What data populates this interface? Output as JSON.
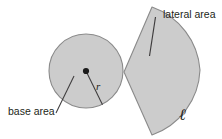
{
  "figure": {
    "labels": {
      "base_area": "base area",
      "lateral_area": "lateral area",
      "radius_symbol": "r",
      "slant_symbol": "ℓ"
    },
    "colors": {
      "shape_fill": "#cccccc",
      "shape_stroke": "#8a8a8a",
      "line": "#3d3b3c",
      "text": "#231f20",
      "background": "#ffffff"
    },
    "geometry": {
      "circle": {
        "cx": 86,
        "cy": 71,
        "r": 37
      },
      "center_dot": {
        "cx": 86,
        "cy": 71,
        "r": 3.1
      },
      "radius_line": {
        "x1": 86,
        "y1": 71,
        "x2": 102.5,
        "y2": 104.8
      },
      "base_leader": {
        "x1": 74,
        "y1": 76,
        "x2": 56,
        "y2": 113
      },
      "lateral_leader": {
        "x1": 155.5,
        "y1": 17,
        "x2": 149.5,
        "y2": 56
      },
      "sector": {
        "apex": {
          "x": 124,
          "y": 72
        },
        "top_vertex": {
          "x": 152,
          "y": 7
        },
        "bottom_vertex": {
          "x": 152,
          "y": 135
        },
        "arc_radius": 72,
        "arc_far_x": 200
      }
    },
    "label_positions": {
      "base_area": {
        "x": 8,
        "y": 115
      },
      "lateral_area": {
        "x": 163,
        "y": 18
      },
      "radius_symbol": {
        "x": 96,
        "y": 90
      },
      "slant_symbol": {
        "x": 179,
        "y": 120
      }
    }
  }
}
